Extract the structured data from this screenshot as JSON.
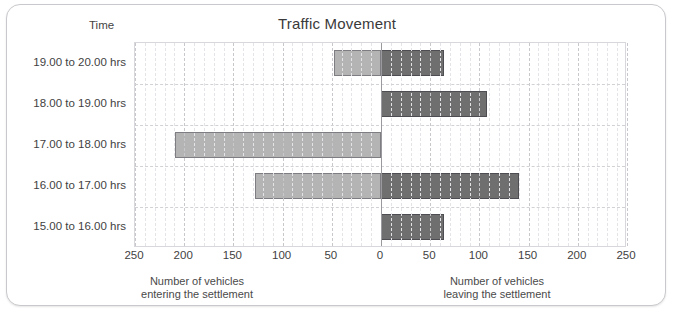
{
  "chart_data": {
    "type": "bar",
    "title": "Traffic Movement",
    "orientation": "horizontal",
    "style": "diverging-bidirectional",
    "categories": [
      "19.00 to 20.00 hrs",
      "18.00 to 19.00 hrs",
      "17.00 to 18.00 hrs",
      "16.00 to 17.00 hrs",
      "15.00 to 16.00 hrs"
    ],
    "category_axis_label": "Time",
    "series": [
      {
        "name": "Number of vehicles entering the settlement",
        "direction": "left",
        "color": "#b4b4b4",
        "values": [
          48,
          0,
          209,
          128,
          0
        ]
      },
      {
        "name": "Number of vehicles leaving the settlement",
        "direction": "right",
        "color": "#6f6f6f",
        "values": [
          64,
          108,
          0,
          140,
          64
        ]
      }
    ],
    "xlabel_left": "Number of vehicles\nentering the settlement",
    "xlabel_right": "Number of vehicles\nleaving the settlement",
    "ylabel": "Time",
    "xlim": [
      -250,
      250
    ],
    "xticks": [
      250,
      200,
      150,
      100,
      50,
      0,
      50,
      100,
      150,
      200,
      250
    ],
    "xtick_step": 50,
    "minor_gridlines": true,
    "grid": true,
    "legend": "none"
  },
  "header": {
    "title": "Traffic Movement",
    "time_label": "Time"
  },
  "axis": {
    "ticks": [
      "250",
      "200",
      "150",
      "100",
      "50",
      "0",
      "50",
      "100",
      "150",
      "200",
      "250"
    ],
    "caption_left_line1": "Number of vehicles",
    "caption_left_line2": "entering the settlement",
    "caption_right_line1": "Number of vehicles",
    "caption_right_line2": "leaving the settlement"
  },
  "rows": [
    {
      "label": "19.00 to 20.00 hrs",
      "entering": 48,
      "leaving": 64
    },
    {
      "label": "18.00 to 19.00 hrs",
      "entering": 0,
      "leaving": 108
    },
    {
      "label": "17.00 to 18.00 hrs",
      "entering": 209,
      "leaving": 0
    },
    {
      "label": "16.00 to 17.00 hrs",
      "entering": 128,
      "leaving": 0
    },
    {
      "label": "15.00 to 16.00 hrs",
      "entering": 0,
      "leaving": 64
    }
  ],
  "colors": {
    "entering": "#b4b4b4",
    "leaving": "#6f6f6f",
    "grid": "#c8c8cc",
    "axis": "#9a9a9e"
  }
}
